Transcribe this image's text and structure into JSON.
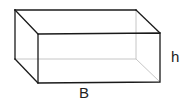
{
  "diagram": {
    "type": "rectangular-prism",
    "colors": {
      "edge": "#1a1a1a",
      "hidden_edge": "#b8b8b8",
      "label": "#222222"
    },
    "labels": {
      "base": "B",
      "height": "h"
    }
  }
}
